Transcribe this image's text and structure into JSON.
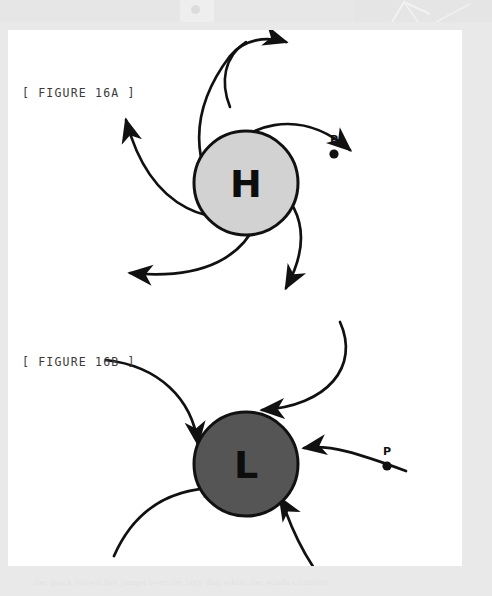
{
  "page": {
    "width": 492,
    "height": 596,
    "background_color": "#e9e9e9",
    "card_color": "#ffffff"
  },
  "ghost_band": {
    "footer_text": "the quick brown fox jumps over the lazy dog while the winds circulate",
    "dot_name": "ghost-dot"
  },
  "figures": [
    {
      "id": "16a",
      "label": "[ FIGURE 16A ]",
      "core_letter": "H",
      "core_fill": "#d2d2d2",
      "core_stroke": "#1a1a1a",
      "center": {
        "x": 238,
        "y": 153
      },
      "radius": 52,
      "flow": "outward-clockwise",
      "point_label": "P",
      "point_position": {
        "x": 326,
        "y": 124
      }
    },
    {
      "id": "16b",
      "label": "[ FIGURE 16B ]",
      "core_letter": "L",
      "core_fill": "#555555",
      "core_stroke": "#1a1a1a",
      "center": {
        "x": 238,
        "y": 434
      },
      "radius": 52,
      "flow": "inward-counterclockwise",
      "point_label": "P",
      "point_position": {
        "x": 379,
        "y": 436
      }
    }
  ],
  "colors": {
    "stroke": "#111111",
    "high_fill": "#d2d2d2",
    "low_fill": "#555555",
    "label_text": "#3a3a3a",
    "background": "#e9e9e9"
  }
}
